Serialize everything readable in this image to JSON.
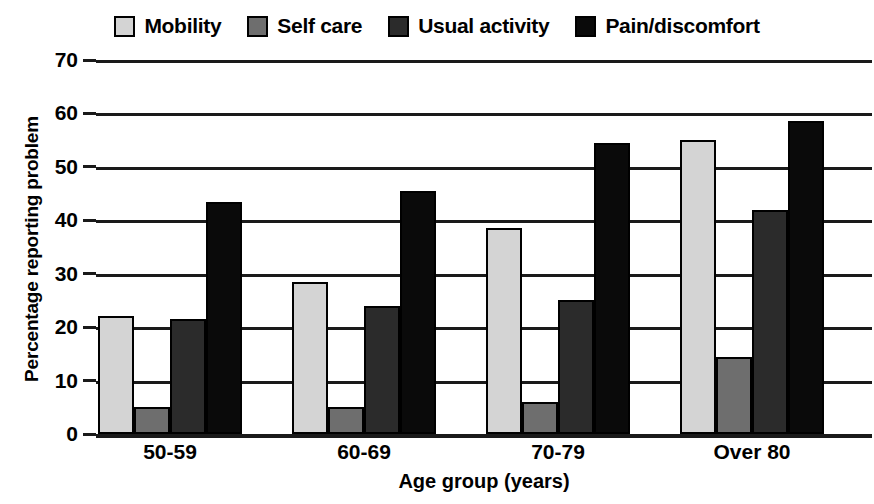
{
  "chart_data": {
    "type": "bar",
    "title": "",
    "subtitle": "",
    "xlabel": "Age group (years)",
    "ylabel": "Percentage reporting problem",
    "categories": [
      "50-59",
      "60-69",
      "70-79",
      "Over 80"
    ],
    "series": [
      {
        "name": "Mobility",
        "color": "#d4d4d4",
        "values": [
          22,
          28.5,
          38.5,
          55
        ]
      },
      {
        "name": "Self care",
        "color": "#6e6e6e",
        "values": [
          5,
          5,
          6,
          14.5
        ]
      },
      {
        "name": "Usual activity",
        "color": "#2b2b2b",
        "values": [
          21.5,
          24,
          25,
          42
        ]
      },
      {
        "name": "Pain/discomfort",
        "color": "#0a0a0a",
        "values": [
          43.5,
          45.5,
          54.5,
          58.5
        ]
      }
    ],
    "ylim": [
      0,
      70
    ],
    "ytick_values": [
      0,
      10,
      20,
      30,
      40,
      50,
      60,
      70
    ],
    "ytick_labels": [
      "0",
      "10",
      "20",
      "30",
      "40",
      "50",
      "60",
      "70"
    ],
    "grid": true,
    "grid_axis": "y",
    "legend_position": "top",
    "bar_border_color": "#000000",
    "axis_color": "#1a1a1a"
  }
}
